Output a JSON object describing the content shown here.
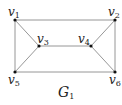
{
  "graph": {
    "name": "G",
    "name_sub": "1",
    "nodes": [
      {
        "id": "v1",
        "base": "v",
        "sub": "1",
        "x": 15,
        "y": 20
      },
      {
        "id": "v2",
        "base": "v",
        "sub": "2",
        "x": 115,
        "y": 20
      },
      {
        "id": "v3",
        "base": "v",
        "sub": "3",
        "x": 39,
        "y": 46
      },
      {
        "id": "v4",
        "base": "v",
        "sub": "4",
        "x": 91,
        "y": 46
      },
      {
        "id": "v5",
        "base": "v",
        "sub": "5",
        "x": 15,
        "y": 72
      },
      {
        "id": "v6",
        "base": "v",
        "sub": "6",
        "x": 115,
        "y": 72
      }
    ],
    "edges": [
      [
        "v1",
        "v2"
      ],
      [
        "v1",
        "v3"
      ],
      [
        "v1",
        "v5"
      ],
      [
        "v2",
        "v4"
      ],
      [
        "v2",
        "v6"
      ],
      [
        "v3",
        "v4"
      ],
      [
        "v3",
        "v5"
      ],
      [
        "v4",
        "v6"
      ],
      [
        "v5",
        "v6"
      ]
    ],
    "colors": {
      "edge": "#8a8a8a",
      "node": "#111111",
      "text": "#222222"
    }
  }
}
